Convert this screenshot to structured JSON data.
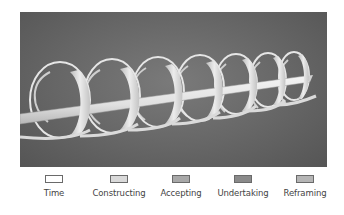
{
  "figure": {
    "background_color": "#666666",
    "arrow_color": "#e8e8e8",
    "ribbon_color": "#d4d4d4",
    "loop_count": 7
  },
  "legend": {
    "items": [
      {
        "label": "Time",
        "swatch_color": "#ffffff"
      },
      {
        "label": "Constructing",
        "swatch_color": "#d9d9d9"
      },
      {
        "label": "Accepting",
        "swatch_color": "#a8a8a8"
      },
      {
        "label": "Undertaking",
        "swatch_color": "#8a8a8a"
      },
      {
        "label": "Reframing",
        "swatch_color": "#b5b5b5"
      }
    ]
  }
}
